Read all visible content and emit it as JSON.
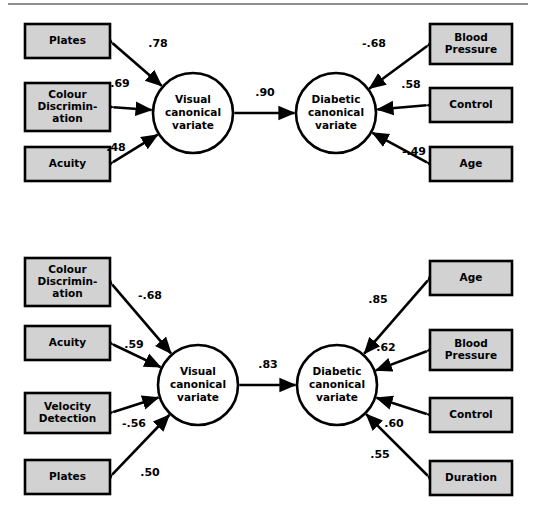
{
  "figure": {
    "type": "path-diagram",
    "background_color": "#ffffff",
    "box_fill_color": "#d2d2d2",
    "box_stroke_color": "#000000",
    "oval_fill_color": "#ffffff",
    "line_color": "#000000",
    "rule_color": "#8e8e8e"
  },
  "chart_data": {
    "type": "diagram",
    "title": "",
    "diagrams": [
      {
        "id": "top",
        "left_variate": "Visual canonical variate",
        "right_variate": "Diabetic canonical variate",
        "between_coefficient": ".90",
        "left_variables": [
          {
            "label": "Plates",
            "coefficient": ".78"
          },
          {
            "label": "Colour Discrimin- ation",
            "coefficient": ".69"
          },
          {
            "label": "Acuity",
            "coefficient": ".48"
          }
        ],
        "right_variables": [
          {
            "label": "Blood Pressure",
            "coefficient": "-.68"
          },
          {
            "label": "Control",
            "coefficient": ".58"
          },
          {
            "label": "Age",
            "coefficient": "-.49"
          }
        ]
      },
      {
        "id": "bottom",
        "left_variate": "Visual canonical variate",
        "right_variate": "Diabetic canonical variate",
        "between_coefficient": ".83",
        "left_variables": [
          {
            "label": "Colour Discrimin- ation",
            "coefficient": "-.68"
          },
          {
            "label": "Acuity",
            "coefficient": ".59"
          },
          {
            "label": "Velocity Detection",
            "coefficient": "-.56"
          },
          {
            "label": "Plates",
            "coefficient": ".50"
          }
        ],
        "right_variables": [
          {
            "label": "Age",
            "coefficient": ".85"
          },
          {
            "label": "Blood Pressure",
            "coefficient": ".62"
          },
          {
            "label": "Control",
            "coefficient": ".60"
          },
          {
            "label": "Duration",
            "coefficient": ".55"
          }
        ]
      }
    ]
  },
  "top_diagram": {
    "left_oval": {
      "line1": "Visual",
      "line2": "canonical",
      "line3": "variate"
    },
    "right_oval": {
      "line1": "Diabetic",
      "line2": "canonical",
      "line3": "variate"
    },
    "center_coefficient": ".90",
    "left_boxes": [
      {
        "lines": [
          "Plates"
        ],
        "coefficient": ".78"
      },
      {
        "lines": [
          "Colour",
          "Discrimin-",
          "ation"
        ],
        "coefficient": ".69"
      },
      {
        "lines": [
          "Acuity"
        ],
        "coefficient": ".48"
      }
    ],
    "right_boxes": [
      {
        "lines": [
          "Blood",
          "Pressure"
        ],
        "coefficient": "-.68"
      },
      {
        "lines": [
          "Control"
        ],
        "coefficient": ".58"
      },
      {
        "lines": [
          "Age"
        ],
        "coefficient": "-.49"
      }
    ]
  },
  "bottom_diagram": {
    "left_oval": {
      "line1": "Visual",
      "line2": "canonical",
      "line3": "variate"
    },
    "right_oval": {
      "line1": "Diabetic",
      "line2": "canonical",
      "line3": "variate"
    },
    "center_coefficient": ".83",
    "left_boxes": [
      {
        "lines": [
          "Colour",
          "Discrimin-",
          "ation"
        ],
        "coefficient": "-.68"
      },
      {
        "lines": [
          "Acuity"
        ],
        "coefficient": ".59"
      },
      {
        "lines": [
          "Velocity",
          "Detection"
        ],
        "coefficient": "-.56"
      },
      {
        "lines": [
          "Plates"
        ],
        "coefficient": ".50"
      }
    ],
    "right_boxes": [
      {
        "lines": [
          "Age"
        ],
        "coefficient": ".85"
      },
      {
        "lines": [
          "Blood",
          "Pressure"
        ],
        "coefficient": ".62"
      },
      {
        "lines": [
          "Control"
        ],
        "coefficient": ".60"
      },
      {
        "lines": [
          "Duration"
        ],
        "coefficient": ".55"
      }
    ]
  }
}
